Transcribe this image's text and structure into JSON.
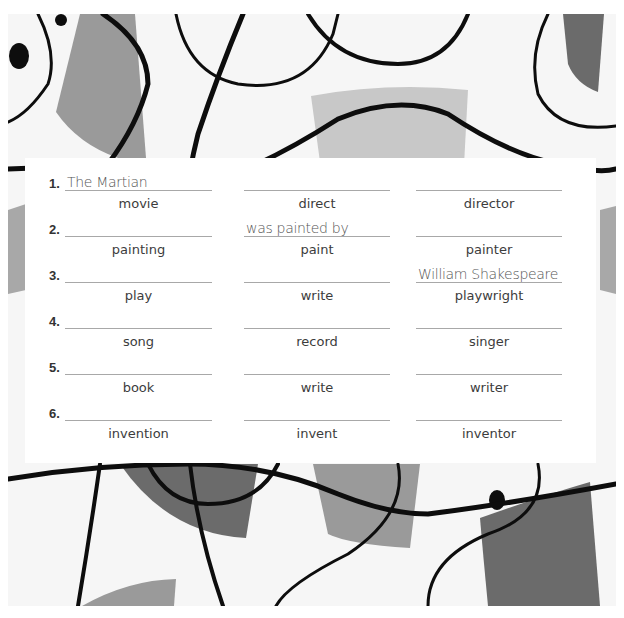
{
  "exercise": {
    "rows": [
      {
        "number": "1.",
        "answer1": "The Martian",
        "answer2": "",
        "answer3": "",
        "noun": "movie",
        "verb": "direct",
        "person": "director"
      },
      {
        "number": "2.",
        "answer1": "",
        "answer2": "was painted by",
        "answer3": "",
        "noun": "painting",
        "verb": "paint",
        "person": "painter"
      },
      {
        "number": "3.",
        "answer1": "",
        "answer2": "",
        "answer3": "William Shakespeare",
        "noun": "play",
        "verb": "write",
        "person": "playwright"
      },
      {
        "number": "4.",
        "answer1": "",
        "answer2": "",
        "answer3": "",
        "noun": "song",
        "verb": "record",
        "person": "singer"
      },
      {
        "number": "5.",
        "answer1": "",
        "answer2": "",
        "answer3": "",
        "noun": "book",
        "verb": "write",
        "person": "writer"
      },
      {
        "number": "6.",
        "answer1": "",
        "answer2": "",
        "answer3": "",
        "noun": "invention",
        "verb": "invent",
        "person": "inventor"
      }
    ]
  },
  "colors": {
    "dark_shape": "#6b6b6b",
    "mid_shape": "#9a9a9a",
    "light_shape": "#c8c8c8",
    "line": "#0d0d0d",
    "background": "#f6f6f6"
  }
}
